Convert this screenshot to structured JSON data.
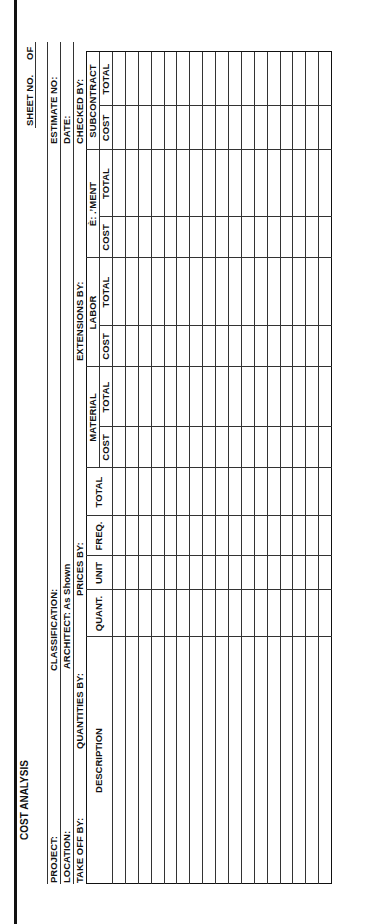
{
  "form": {
    "title": "COST ANALYSIS",
    "sheet_no_label": "SHEET NO.",
    "sheet_of_label": "OF"
  },
  "info": {
    "project": "PROJECT:",
    "location": "LOCATION:",
    "take_off_by": "TAKE OFF BY:",
    "classification": "CLASSIFICATION:",
    "architect": "ARCHITECT: As Shown",
    "quantities_by": "QUANTITIES BY:",
    "prices_by": "PRICES BY:",
    "extensions_by": "EXTENSIONS BY:",
    "estimate_no": "ESTIMATE NO:",
    "date": "DATE:",
    "checked_by": "CHECKED BY:"
  },
  "table": {
    "groups": {
      "material": "MATERIAL",
      "labor": "LABOR",
      "equipment": "È: .ʼMENT",
      "subcontract": "SUBCONTRACT"
    },
    "columns": {
      "description": "DESCRIPTION",
      "quant": "QUANT.",
      "unit": "UNIT",
      "freq": "FREQ.",
      "total": "TOTAL",
      "material_cost": "COST",
      "material_total": "TOTAL",
      "labor_cost": "COST",
      "labor_total": "TOTAL",
      "equipment_cost": "COST",
      "equipment_total": "TOTAL",
      "subcontract_cost": "COST",
      "subcontract_total": "TOTAL"
    },
    "row_count": 17
  }
}
